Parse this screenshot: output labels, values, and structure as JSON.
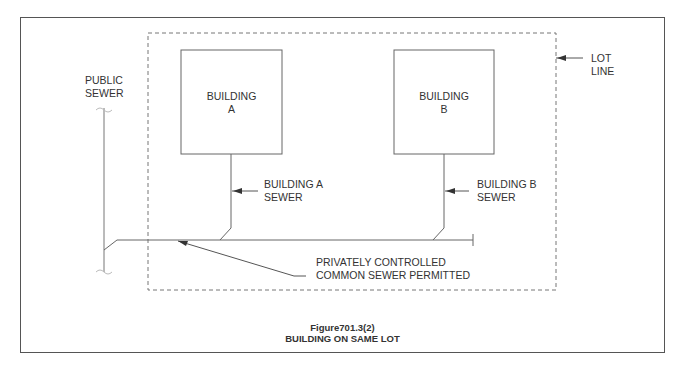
{
  "figure": {
    "number": "Figure701.3(2)",
    "title": "BUILDING ON SAME LOT"
  },
  "labels": {
    "public_sewer": [
      "PUBLIC",
      "SEWER"
    ],
    "lot_line": [
      "LOT",
      "LINE"
    ],
    "building_a": [
      "BUILDING",
      "A"
    ],
    "building_b": [
      "BUILDING",
      "B"
    ],
    "building_a_sewer": [
      "BUILDING A",
      "SEWER"
    ],
    "building_b_sewer": [
      "BUILDING B",
      "SEWER"
    ],
    "common_sewer": [
      "PRIVATELY CONTROLLED",
      "COMMON SEWER PERMITTED"
    ]
  },
  "colors": {
    "line": "#666666",
    "text": "#333333",
    "border": "#555555"
  }
}
